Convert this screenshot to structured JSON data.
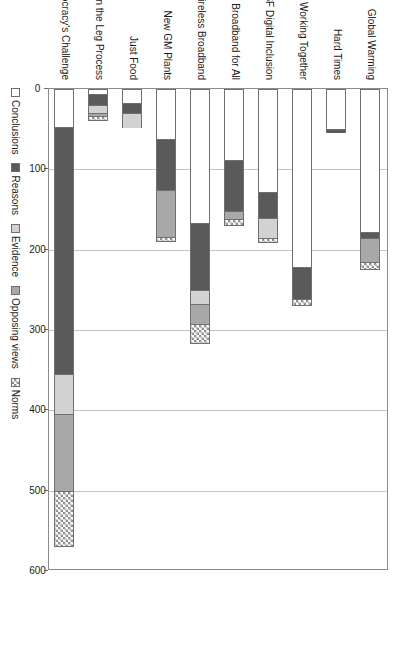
{
  "chart_data": {
    "type": "bar",
    "subtype": "stacked-vertical",
    "title": "",
    "subtitle": "",
    "xlabel": "",
    "ylabel": "",
    "ylim": [
      0,
      600
    ],
    "y_ticks": [
      0,
      100,
      200,
      300,
      400,
      500,
      600
    ],
    "y_tick_labels": [
      "0",
      "100",
      "200",
      "300",
      "400",
      "500",
      "600"
    ],
    "grid": "horizontal-value-gridlines",
    "legend_position": "bottom",
    "orientation": "figure rotated 90 degrees on page",
    "categories": [
      "Global Warming",
      "Hard Times",
      "Working Together",
      "SF Digital Inclusion",
      "Broadband for All",
      "Wireless Broadband",
      "New GM Plants",
      "Just Food",
      "Citizens in the Leg Process",
      "Democracy's Challenge"
    ],
    "series": [
      {
        "name": "Conclusions",
        "color": "#ffffff",
        "pattern": "solid",
        "values": [
          178,
          50,
          222,
          128,
          88,
          167,
          62,
          18,
          6,
          47
        ]
      },
      {
        "name": "Reasons",
        "color": "#5a5a5a",
        "pattern": "solid",
        "values": [
          7,
          5,
          40,
          32,
          64,
          83,
          64,
          12,
          14,
          308
        ]
      },
      {
        "name": "Evidence",
        "color": "#d2d2d2",
        "pattern": "solid",
        "values": [
          0,
          0,
          0,
          26,
          0,
          18,
          0,
          18,
          10,
          50
        ]
      },
      {
        "name": "Opposing views",
        "color": "#a8a8a8",
        "pattern": "solid",
        "values": [
          30,
          0,
          0,
          0,
          10,
          24,
          58,
          0,
          4,
          95
        ]
      },
      {
        "name": "Norms",
        "color": "#8a8a8a",
        "pattern": "checkered",
        "values": [
          10,
          0,
          8,
          6,
          8,
          26,
          6,
          0,
          6,
          70
        ]
      }
    ],
    "totals": [
      225,
      55,
      270,
      192,
      170,
      318,
      190,
      48,
      40,
      570
    ]
  },
  "legend": {
    "items": [
      {
        "label": "Conclusions",
        "swatch": "conclusions-swatch"
      },
      {
        "label": "Reasons",
        "swatch": "reasons-swatch"
      },
      {
        "label": "Evidence",
        "swatch": "evidence-swatch"
      },
      {
        "label": "Opposing views",
        "swatch": "opposing-views-swatch"
      },
      {
        "label": "Norms",
        "swatch": "norms-swatch"
      }
    ]
  }
}
